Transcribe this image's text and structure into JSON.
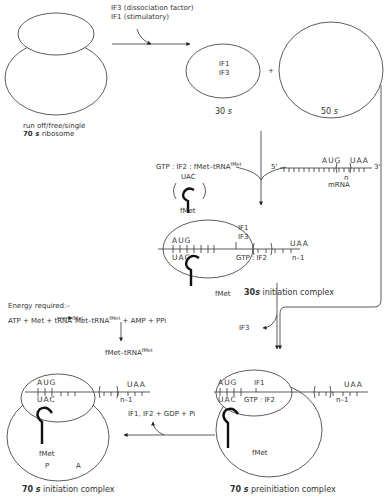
{
  "diagram": {
    "ribosome_70s": {
      "label_line1": "run off/free/single",
      "label_num": "70",
      "label_unit": "s",
      "label_rest": "ribosome"
    },
    "dissociation_step": {
      "factor1": "IF3 (dissociation factor)",
      "factor2": "IF1 (stimulatory)"
    },
    "subunit_30s": {
      "content1": "IF1",
      "content2": "IF3",
      "label_num": "30",
      "label_unit": "s"
    },
    "plus": "+",
    "subunit_50s": {
      "label_num": "50",
      "label_unit": "s"
    },
    "ternary": {
      "label": "GTP : IF2 : fMet–tRNA",
      "sup": "fMet",
      "anticodon": "UAC",
      "amino": "fMet"
    },
    "mrna": {
      "five": "5'",
      "three": "3'",
      "start": "AUG",
      "stop": "UAA",
      "n": "n",
      "label": "mRNA"
    },
    "complex_30s": {
      "codon": "AUG",
      "anticodon": "UAC",
      "if1": "IF1",
      "if3": "IF3",
      "gtp_if2": "GTP : IF2",
      "n1": "n–1",
      "stop": "UAA",
      "amino": "fMet",
      "label_num": "30",
      "label_unit": "s",
      "label_rest": "initiation complex"
    },
    "energy": {
      "heading": "Energy required:–",
      "reactants": "ATP + Met + tRNA",
      "reactants_sup": "fMet",
      "products": "Met–tRNA",
      "products_sup": "fMet",
      "products_rest": "+ AMP + PPi",
      "formyl": "fMet–tRNA",
      "formyl_sup": "fMet"
    },
    "if3_release": "IF3",
    "complex_70s_pre": {
      "codon": "AUG",
      "anticodon": "UAC",
      "if1": "IF1",
      "gtp_if2": "GTP : IF2",
      "n1": "n–1",
      "stop": "UAA",
      "amino": "fMet",
      "label_num": "70",
      "label_unit": "s",
      "label_rest": "preinitiation complex"
    },
    "release": "IF1, IF2 + GDP + Pi",
    "complex_70s_init": {
      "codon": "AUG",
      "anticodon": "UAC",
      "n1": "n–1",
      "stop": "UAA",
      "amino": "fMet",
      "site_p": "P",
      "site_a": "A",
      "label_num": "70",
      "label_unit": "s",
      "label_rest": "initiation complex"
    },
    "colors": {
      "line": "#333333",
      "trna": "#111111",
      "background": "#ffffff"
    }
  }
}
